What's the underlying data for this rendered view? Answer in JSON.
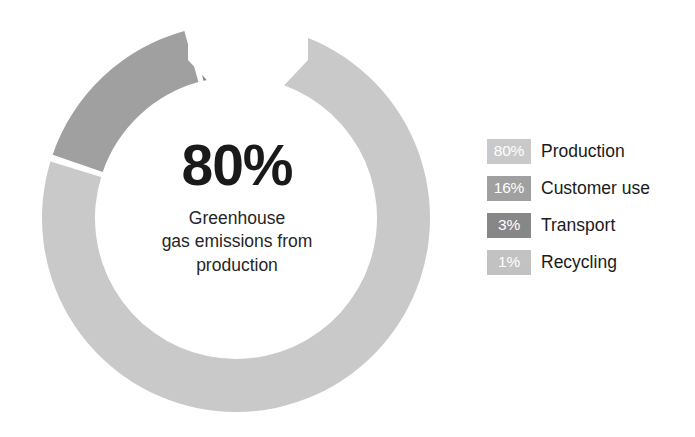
{
  "chart_data": {
    "type": "pie",
    "variant": "donut",
    "title": "",
    "center_value": "80%",
    "center_description": "Greenhouse\ngas emissions from\nproduction",
    "center_description_lines": [
      "Greenhouse",
      "gas emissions from",
      "production"
    ],
    "categories": [
      "Production",
      "Customer use",
      "Transport",
      "Recycling"
    ],
    "values": [
      80,
      16,
      3,
      1
    ],
    "value_labels": [
      "80%",
      "16%",
      "3%",
      "1%"
    ],
    "unit": "%",
    "colors": [
      "#c9c9c9",
      "#a0a0a0",
      "#878787",
      "#c2c2c2"
    ],
    "legend_position": "right",
    "grid": false,
    "slices": [
      {
        "label": "Production",
        "value": 80,
        "value_label": "80%",
        "color": "#c9c9c9"
      },
      {
        "label": "Customer use",
        "value": 16,
        "value_label": "16%",
        "color": "#a0a0a0"
      },
      {
        "label": "Transport",
        "value": 3,
        "value_label": "3%",
        "color": "#878787"
      },
      {
        "label": "Recycling",
        "value": 1,
        "value_label": "1%",
        "color": "#c2c2c2"
      }
    ]
  },
  "center": {
    "percent": "80%",
    "line1": "Greenhouse",
    "line2": "gas emissions from",
    "line3": "production"
  },
  "legend": {
    "items": [
      {
        "value": "80%",
        "label": "Production",
        "color": "#c9c9c9"
      },
      {
        "value": "16%",
        "label": "Customer use",
        "color": "#a0a0a0"
      },
      {
        "value": "3%",
        "label": "Transport",
        "color": "#878787"
      },
      {
        "value": "1%",
        "label": "Recycling",
        "color": "#c2c2c2"
      }
    ]
  }
}
